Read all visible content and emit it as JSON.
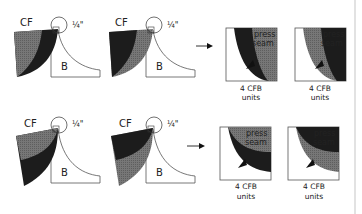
{
  "diagram": {
    "colors": {
      "dark": "#1c1c1c",
      "medium": "#6e6e6e",
      "outline": "#444444",
      "background": "#ffffff",
      "divider": "#d8d8d8"
    },
    "rows": [
      {
        "units": [
          {
            "cf_label": "CF",
            "b_label": "B",
            "seam_label": "¼\"",
            "front_fabric": "medium",
            "back_fabric": "dark"
          },
          {
            "cf_label": "CF",
            "b_label": "B",
            "seam_label": "¼\"",
            "front_fabric": "dark",
            "back_fabric": "medium"
          }
        ],
        "results": [
          {
            "press_label": "press",
            "seam_label": "seam",
            "caption_line1": "4 CFB",
            "caption_line2": "units"
          },
          {
            "press_label": "press",
            "seam_label": "seam",
            "caption_line1": "4 CFB",
            "caption_line2": "units"
          }
        ]
      },
      {
        "units": [
          {
            "cf_label": "CF",
            "b_label": "B",
            "seam_label": "¼\"",
            "front_fabric": "medium",
            "back_fabric": "dark"
          },
          {
            "cf_label": "CF",
            "b_label": "B",
            "seam_label": "¼\"",
            "front_fabric": "dark",
            "back_fabric": "medium"
          }
        ],
        "results": [
          {
            "press_label": "press",
            "seam_label": "seam",
            "caption_line1": "4 CFB",
            "caption_line2": "units"
          },
          {
            "press_label": "press",
            "seam_label": "seam",
            "caption_line1": "4 CFB",
            "caption_line2": "units"
          }
        ]
      }
    ]
  }
}
